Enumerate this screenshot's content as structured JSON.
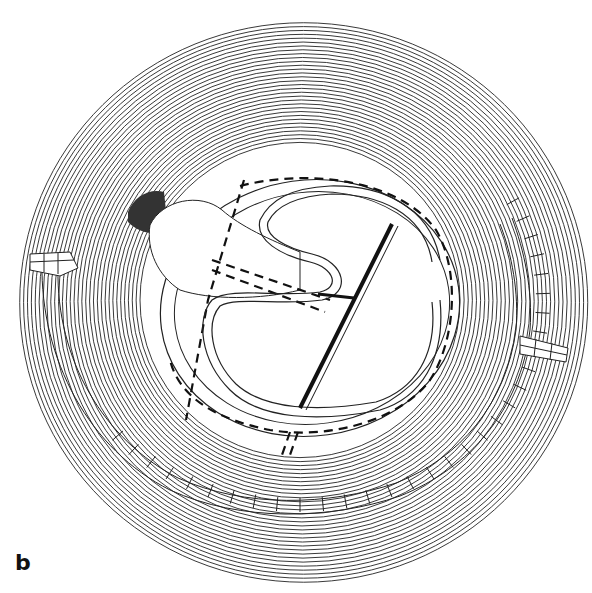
{
  "figure": {
    "panel_label": "b",
    "colors": {
      "ink": "#1a1a1a",
      "background": "#ffffff"
    },
    "elements": [
      "concentric-ring-lines",
      "outer-brick-wall-arc",
      "left-wall-entrance",
      "right-wall-entrance",
      "central-platform",
      "dashed-outlines",
      "serpentine-channel",
      "diagonal-channel",
      "dark-shaded-area"
    ]
  }
}
